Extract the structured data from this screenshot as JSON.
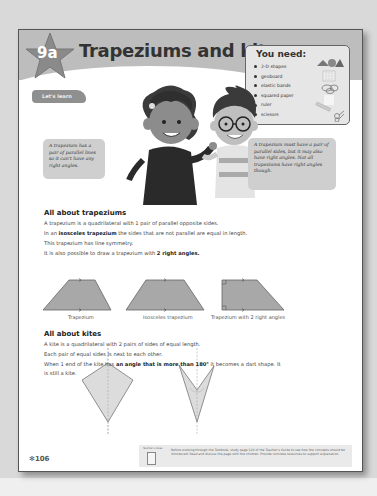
{
  "header": {
    "chapter": "9a",
    "title": "Trapeziums and kites"
  },
  "you_need": {
    "title": "You need:",
    "items": [
      "2-D shapes",
      "geoboard",
      "elastic bands",
      "squared paper",
      "ruler",
      "scissors"
    ]
  },
  "lets_learn_label": "Let's learn",
  "bubbles": {
    "left": "A trapezium has a pair of parallel lines so it can't have any right angles.",
    "right": "A trapezium must have a pair of parallel sides, but it may also have right angles. Not all trapeziums have right angles though."
  },
  "trapeziums": {
    "heading": "All about trapeziums",
    "line1": "A trapezium is a quadrilateral with 1 pair of parallel opposite sides.",
    "line2_pre": "In an ",
    "line2_bold": "isosceles trapezium",
    "line2_post": " the sides that are not parallel are equal in length.",
    "line3": "This trapezium has line symmetry.",
    "line4_pre": "It is also possible to draw a trapezium with ",
    "line4_bold": "2 right angles.",
    "shape_labels": [
      "Trapezium",
      "Isosceles trapezium",
      "Trapezium with 2 right angles"
    ]
  },
  "kites": {
    "heading": "All about kites",
    "line1": "A kite is a quadrilateral with 2 pairs of sides of equal length.",
    "line2": "Each pair of equal sides is next to each other.",
    "line3_pre": "When 1 end of the kite has ",
    "line3_bold": "an angle that is more than 180°",
    "line3_post": " it becomes a dart shape. It",
    "line4": "is still a kite."
  },
  "footer": {
    "page_number": "106",
    "teacher_label": "Teacher's notes",
    "teacher_note": "Before working through the Textbook, study page 120 of the Teacher's Guide to see how the concepts should be introduced. Read and discuss the page with the children. Provide concrete resources to support explanation."
  },
  "colors": {
    "banner": "#bdbdbd",
    "shape_fill": "#a8a8a8",
    "kite_fill": "#dcdcdc"
  }
}
